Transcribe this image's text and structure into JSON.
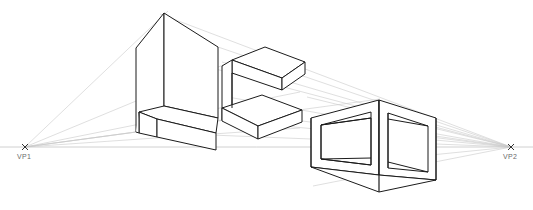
{
  "drawing": {
    "title": "Two-Point Perspective Construction",
    "canvas": {
      "width": 533,
      "height": 210,
      "background": "#ffffff"
    },
    "styles": {
      "object_stroke": "#1b1b1b",
      "object_stroke_light": "#3a3a3a",
      "construction_stroke": "#c9c9c9",
      "horizon_stroke": "#c4c4c4",
      "vp_marker_stroke": "#333333",
      "label_color": "#6b6b6b"
    },
    "horizon": {
      "name": "horizon-line",
      "y": 147,
      "x1": 0,
      "x2": 533
    },
    "vanishing_points": [
      {
        "id": "vp1",
        "label": "VP1",
        "x": 25,
        "y": 147,
        "label_x": 17,
        "label_y": 158
      },
      {
        "id": "vp2",
        "label": "VP2",
        "x": 511,
        "y": 147,
        "label_x": 503,
        "label_y": 158
      }
    ],
    "construction_lines": [
      {
        "from": "vp1",
        "to_x": 164,
        "to_y": 13
      },
      {
        "from": "vp1",
        "to_x": 136,
        "to_y": 48
      },
      {
        "from": "vp1",
        "to_x": 233,
        "to_y": 110
      },
      {
        "from": "vp1",
        "to_x": 310,
        "to_y": 96
      },
      {
        "from": "vp1",
        "to_x": 379,
        "to_y": 100
      },
      {
        "from": "vp1",
        "to_x": 440,
        "to_y": 118
      },
      {
        "from": "vp1",
        "to_x": 430,
        "to_y": 188
      },
      {
        "from": "vp2",
        "to_x": 164,
        "to_y": 13
      },
      {
        "from": "vp2",
        "to_x": 136,
        "to_y": 48
      },
      {
        "from": "vp2",
        "to_x": 222,
        "to_y": 45
      },
      {
        "from": "vp2",
        "to_x": 232,
        "to_y": 60
      },
      {
        "from": "vp2",
        "to_x": 228,
        "to_y": 95
      },
      {
        "from": "vp2",
        "to_x": 222,
        "to_y": 118
      },
      {
        "from": "vp2",
        "to_x": 233,
        "to_y": 110
      },
      {
        "from": "vp2",
        "to_x": 310,
        "to_y": 96
      },
      {
        "from": "vp2",
        "to_x": 312,
        "to_y": 186
      },
      {
        "from": "vp2",
        "to_x": 318,
        "to_y": 117
      },
      {
        "from": "vp2",
        "to_x": 318,
        "to_y": 167
      }
    ],
    "objects": [
      {
        "id": "left-block",
        "name": "left-building-block",
        "description": "Tall box with protruding lower slab, L-shaped massing"
      },
      {
        "id": "middle-block",
        "name": "middle-bracket-block",
        "description": "C-shaped bracket form with two horizontal slabs"
      },
      {
        "id": "right-cube",
        "name": "right-hollow-cube",
        "description": "Hollow cube frame with recessed openings on both visible faces"
      }
    ]
  }
}
